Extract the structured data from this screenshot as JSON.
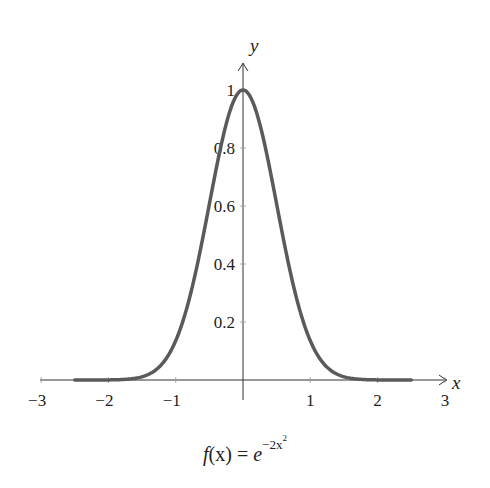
{
  "chart_data": {
    "type": "line",
    "title": "",
    "caption": "f(x) = e^{-2x^2}",
    "caption_parts": {
      "lhs_f": "f",
      "lhs_arg": "(x)",
      "eq": " = ",
      "base": "e",
      "exponent": "−2x",
      "exponent_power": "2"
    },
    "xlabel": "x",
    "ylabel": "y",
    "xlim": [
      -3,
      3
    ],
    "ylim": [
      0,
      1
    ],
    "x_ticks": [
      -3,
      -2,
      -1,
      1,
      2,
      3
    ],
    "x_tick_labels": [
      "−3",
      "−2",
      "−1",
      "1",
      "2",
      "3"
    ],
    "y_ticks": [
      0.2,
      0.4,
      0.6,
      0.8,
      1
    ],
    "y_tick_labels": [
      "0.2",
      "0.4",
      "0.6",
      "0.8",
      "1"
    ],
    "grid": false,
    "legend": null,
    "series": [
      {
        "name": "f(x) = e^(-2x^2)",
        "function": "exp(-2*x^2)",
        "domain": [
          -2.5,
          2.5
        ],
        "color": "#5a5a5a",
        "x": [
          -2.5,
          -2.0,
          -1.5,
          -1.25,
          -1.0,
          -0.75,
          -0.5,
          -0.25,
          0,
          0.25,
          0.5,
          0.75,
          1.0,
          1.25,
          1.5,
          2.0,
          2.5
        ],
        "y": [
          0.0,
          0.0003,
          0.0111,
          0.0439,
          0.1353,
          0.3247,
          0.6065,
          0.8825,
          1.0,
          0.8825,
          0.6065,
          0.3247,
          0.1353,
          0.0439,
          0.0111,
          0.0003,
          0.0
        ]
      }
    ]
  },
  "colors": {
    "axis": "#333333",
    "curve": "#5a5a5a",
    "background": "#ffffff"
  }
}
